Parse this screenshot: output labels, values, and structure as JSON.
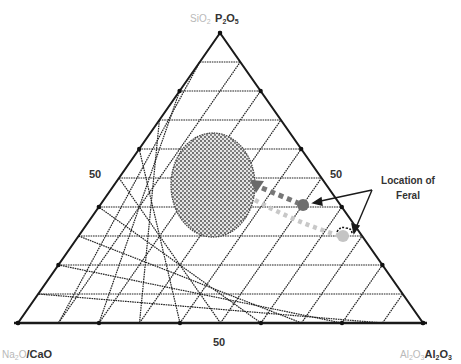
{
  "diagram": {
    "type": "ternary",
    "subdivisions": 10,
    "vertices": {
      "top": {
        "faint_label_parts": [
          "SiO",
          "2"
        ],
        "bold_label_parts": [
          "P",
          "2",
          "O",
          "5"
        ]
      },
      "bottom_left": {
        "faint_label_parts": [
          "Na",
          "2",
          "O"
        ],
        "bold_label": "/CaO"
      },
      "bottom_right": {
        "faint_label_parts": [
          "Al",
          "2",
          "O",
          "3"
        ],
        "bold_label_parts": [
          "Al",
          "2",
          "O",
          "3"
        ]
      }
    },
    "tick_labels": {
      "left_edge": "50",
      "right_edge": "50",
      "bottom_edge": "50"
    },
    "annotation": {
      "line1": "Location of",
      "line2": "Feral"
    },
    "colors": {
      "grid": "#222222",
      "outline": "#1a1a1a",
      "dark_marker": "#6e6e6e",
      "light_marker": "#c4c4c4",
      "stippled_region": "#555555"
    },
    "features": [
      {
        "name": "stippled-ellipse-region",
        "center": [
          213,
          185
        ],
        "rx": 42,
        "ry": 52
      },
      {
        "name": "dark-dotted-path",
        "from": [
          257,
          186
        ],
        "to": [
          303,
          205
        ],
        "marker": "dark"
      },
      {
        "name": "light-dotted-path",
        "from": [
          255,
          200
        ],
        "to": [
          343,
          236
        ],
        "marker": "light"
      }
    ]
  }
}
